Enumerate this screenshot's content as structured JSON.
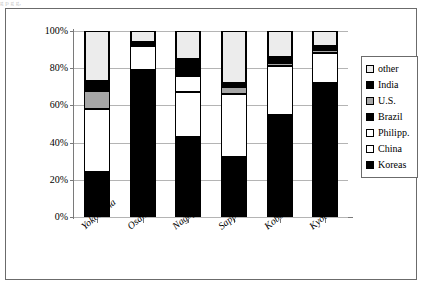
{
  "artifact": {
    "top_text": "g  p          g        g,"
  },
  "chart_data": {
    "type": "bar",
    "stacked": true,
    "title": "",
    "subtitle": "",
    "xlabel": "",
    "ylabel": "",
    "ylim": [
      0,
      100
    ],
    "y_ticks": [
      "0%",
      "20%",
      "40%",
      "60%",
      "80%",
      "100%"
    ],
    "y_tick_values": [
      0,
      20,
      40,
      60,
      80,
      100
    ],
    "grid": true,
    "legend_position": "right",
    "categories": [
      "Yokohama",
      "Osaka",
      "Nagoya",
      "Sapporo",
      "Kobe",
      "Kyoto"
    ],
    "series": [
      {
        "name": "Koreas",
        "color": "#000000",
        "values": [
          24,
          79,
          43,
          32,
          55,
          72
        ]
      },
      {
        "name": "China",
        "color": "#ffffff",
        "values": [
          34,
          13,
          24,
          34,
          26,
          16
        ]
      },
      {
        "name": "Philipp.",
        "color": "#ffffff",
        "values": [
          0,
          0,
          9,
          0,
          0,
          0
        ]
      },
      {
        "name": "Brazil",
        "color": "#000000",
        "values": [
          0,
          0,
          0,
          0,
          0,
          0
        ]
      },
      {
        "name": "U.S.",
        "color": "#a6a6a6",
        "values": [
          10,
          0,
          0,
          4,
          2,
          2
        ]
      },
      {
        "name": "India",
        "color": "#000000",
        "values": [
          5,
          2,
          9,
          2,
          3,
          2
        ]
      },
      {
        "name": "other",
        "color": "#ececec",
        "values": [
          27,
          6,
          15,
          28,
          14,
          8
        ]
      }
    ],
    "legend_entries": [
      {
        "label": "other",
        "swatch": "#ececec"
      },
      {
        "label": "India",
        "swatch": "#000000"
      },
      {
        "label": "U.S.",
        "swatch": "#a6a6a6"
      },
      {
        "label": "Brazil",
        "swatch": "#000000"
      },
      {
        "label": "Philipp.",
        "swatch": "#ffffff"
      },
      {
        "label": "China",
        "swatch": "#ffffff"
      },
      {
        "label": "Koreas",
        "swatch": "#000000"
      }
    ]
  }
}
